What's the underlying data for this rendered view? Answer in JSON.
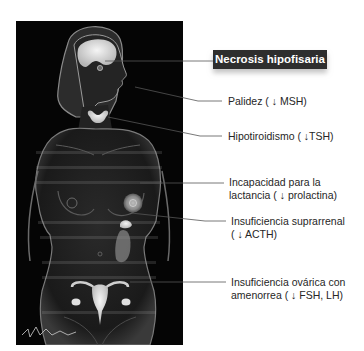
{
  "figure": {
    "title": "Necrosis hipofisaria",
    "labels": [
      {
        "id": "palidez",
        "lines": [
          "Palidez ( ↓ MSH)"
        ]
      },
      {
        "id": "hipotiroidismo",
        "lines": [
          "Hipotiroidismo ( ↓TSH)"
        ]
      },
      {
        "id": "lactancia",
        "lines": [
          "Incapacidad para la",
          "lactancia ( ↓ prolactina)"
        ]
      },
      {
        "id": "suprarrenal",
        "lines": [
          "Insuficiencia suprarrenal",
          "( ↓ ACTH)"
        ]
      },
      {
        "id": "ovarica",
        "lines": [
          "Insuficiencia ovárica con",
          "amenorrea ( ↓ FSH, LH)"
        ]
      }
    ],
    "colors": {
      "panel_background": "#050505",
      "title_background": "#2e2e2e",
      "title_text": "#ffffff",
      "label_text": "#262626",
      "connector": "#555555",
      "organ_highlight": "#e8e8e8"
    }
  }
}
